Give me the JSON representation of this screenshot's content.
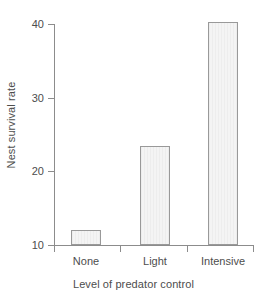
{
  "chart_data": {
    "type": "bar",
    "title": "",
    "subtitle": "",
    "xlabel": "Level of predator control",
    "ylabel": "Nest survival rate",
    "categories": [
      "None",
      "Light",
      "Intensive"
    ],
    "values": [
      12.1,
      23.5,
      40.3
    ],
    "series": [
      {
        "name": "Nest survival rate",
        "values": [
          12.1,
          23.5,
          40.3
        ]
      }
    ],
    "ylim": [
      10,
      40.5
    ],
    "yticks": [
      10,
      20,
      30,
      40
    ],
    "ytick_labels": [
      "10",
      "20",
      "30",
      "40"
    ],
    "xtick_count": 4,
    "grid": false,
    "legend": null,
    "annotations": [],
    "colors": {
      "bar_fill": "#f0f0f0",
      "bar_border": "#999999",
      "axis": "#8c8c8c",
      "text": "#4d4d4d",
      "background": "#ffffff"
    }
  }
}
